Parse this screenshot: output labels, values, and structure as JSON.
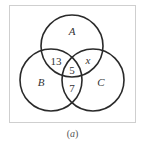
{
  "diagram": {
    "type": "venn-3",
    "sets": [
      {
        "id": "A",
        "label": "A",
        "cx": 72,
        "cy": 46,
        "r": 31
      },
      {
        "id": "B",
        "label": "B",
        "cx": 51,
        "cy": 80,
        "r": 31
      },
      {
        "id": "C",
        "label": "C",
        "cx": 93,
        "cy": 80,
        "r": 31
      }
    ],
    "regions": {
      "A_and_B_only": "13",
      "A_and_C_only": "x",
      "A_and_B_and_C": "5",
      "B_and_C_only": "7"
    },
    "colors": {
      "circle_stroke": "#2a2a2a",
      "frame_stroke": "#cfcfcf",
      "text": "#333333"
    }
  },
  "caption": {
    "open": "(",
    "letter": "a",
    "close": ")"
  }
}
